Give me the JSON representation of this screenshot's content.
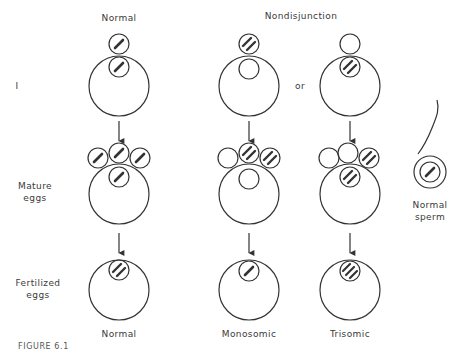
{
  "headers": {
    "normal": "Normal",
    "nondisjunction": "Nondisjunction"
  },
  "row_labels": {
    "stage_one": "I",
    "mature_line1": "Mature",
    "mature_line2": "eggs",
    "fertilized_line1": "Fertilized",
    "fertilized_line2": "eggs"
  },
  "connector": "or",
  "sperm": {
    "line1": "Normal",
    "line2": "sperm"
  },
  "outcomes": {
    "normal": "Normal",
    "monosomic": "Monosomic",
    "trisomic": "Trisomic"
  },
  "caption": "FIGURE 6.1",
  "colors": {
    "stroke": "#333333",
    "background": "#ffffff"
  }
}
